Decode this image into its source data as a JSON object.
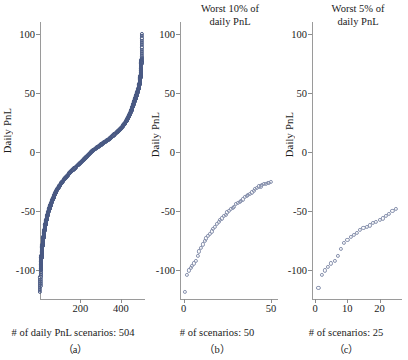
{
  "figure": {
    "ylabel": "Daily PnL",
    "ylim": [
      -125,
      110
    ],
    "yticks": [
      100,
      50,
      0,
      -50,
      -100
    ],
    "ytick_labels": [
      "100",
      "50",
      "0",
      "-50",
      "-100"
    ]
  },
  "panels": [
    {
      "id": "a",
      "title": "",
      "subcaption": "（a）",
      "xcaption": "# of daily PnL scenarios: 504",
      "xlim": [
        0,
        520
      ],
      "xticks": [
        200,
        400
      ],
      "xtick_labels": [
        "200",
        "400"
      ],
      "n_scenarios": 504,
      "dense": true
    },
    {
      "id": "b",
      "title": "Worst 10% of\ndaily PnL",
      "subcaption": "（b）",
      "xcaption": "# of scenarios: 50",
      "xlim": [
        -2,
        54
      ],
      "xticks": [
        0,
        50
      ],
      "xtick_labels": [
        "0",
        "50"
      ],
      "n_scenarios": 50,
      "dense": false
    },
    {
      "id": "c",
      "title": "Worst 5% of\ndaily PnL",
      "subcaption": "（c）",
      "xcaption": "# of scenarios: 25",
      "xlim": [
        -1,
        27
      ],
      "xticks": [
        0,
        10,
        20
      ],
      "xtick_labels": [
        "0",
        "10",
        "20"
      ],
      "n_scenarios": 25,
      "dense": false
    }
  ],
  "chart_data": {
    "type": "scatter",
    "xlabel": "# of scenarios",
    "ylabel": "Daily PnL",
    "ylim": [
      -125,
      110
    ],
    "grid": false,
    "legend": null,
    "marker": "open-circle",
    "colors": {
      "dense_markers": "#4a5a84",
      "sparse_markers": "#8791ad",
      "axis": "#9a9a9a",
      "text": "#1a1a1a",
      "background": "#ffffff"
    },
    "panels": [
      {
        "id": "a",
        "label": "(a)",
        "title": "",
        "xlabel": "# of daily PnL scenarios: 504",
        "n_points": 504,
        "xlim": [
          0,
          520
        ],
        "xticks": [
          200,
          400
        ],
        "yticks": [
          100,
          50,
          0,
          -50,
          -100
        ],
        "description": "Sorted ascending daily PnL for all 504 scenarios; steep negative tail below index 40, flat sigmoid centre, steep positive tail above index 460.",
        "x": [
          1,
          3,
          5,
          7,
          9,
          11,
          14,
          17,
          20,
          24,
          28,
          32,
          36,
          40,
          46,
          52,
          60,
          70,
          80,
          95,
          110,
          130,
          150,
          175,
          200,
          225,
          252,
          275,
          300,
          325,
          350,
          375,
          395,
          415,
          430,
          442,
          452,
          460,
          466,
          472,
          478,
          483,
          488,
          492,
          496,
          499,
          501,
          503,
          504
        ],
        "y": [
          -118,
          -100,
          -95,
          -88,
          -84,
          -80,
          -76,
          -72,
          -68,
          -64,
          -60,
          -57,
          -54,
          -51,
          -48,
          -45,
          -41,
          -37,
          -33,
          -29,
          -25,
          -21,
          -17,
          -13,
          -9,
          -5,
          0,
          3,
          6,
          9,
          12,
          16,
          19,
          23,
          27,
          31,
          35,
          39,
          42,
          45,
          48,
          51,
          54,
          57,
          62,
          66,
          72,
          80,
          100
        ]
      },
      {
        "id": "b",
        "label": "(b)",
        "title": "Worst 10% of daily PnL",
        "xlabel": "# of scenarios: 50",
        "n_points": 50,
        "xlim": [
          -2,
          54
        ],
        "xticks": [
          0,
          50
        ],
        "yticks": [
          100,
          50,
          0,
          -50,
          -100
        ],
        "description": "Worst 10% tail: 50 sorted points rising concavely from about -118 to about -25.",
        "x": [
          1,
          2,
          3,
          4,
          5,
          6,
          7,
          8,
          9,
          10,
          11,
          12,
          13,
          14,
          15,
          16,
          17,
          18,
          19,
          20,
          21,
          22,
          23,
          24,
          25,
          26,
          27,
          28,
          29,
          30,
          31,
          32,
          33,
          34,
          35,
          36,
          37,
          38,
          39,
          40,
          41,
          42,
          43,
          44,
          45,
          46,
          47,
          48,
          49,
          50
        ],
        "y": [
          -118,
          -104,
          -100,
          -98,
          -96,
          -94,
          -92,
          -88,
          -84,
          -81,
          -78,
          -75,
          -73,
          -71,
          -69,
          -67,
          -65,
          -63,
          -61,
          -59,
          -57,
          -56,
          -54,
          -53,
          -51,
          -50,
          -48,
          -47,
          -46,
          -44,
          -43,
          -42,
          -41,
          -40,
          -38,
          -37,
          -36,
          -35,
          -34,
          -33,
          -31,
          -30,
          -29,
          -29,
          -28,
          -27,
          -27,
          -26,
          -26,
          -25
        ]
      },
      {
        "id": "c",
        "label": "(c)",
        "title": "Worst 5% of daily PnL",
        "xlabel": "# of scenarios: 25",
        "n_points": 25,
        "xlim": [
          -1,
          27
        ],
        "xticks": [
          0,
          10,
          20
        ],
        "yticks": [
          100,
          50,
          0,
          -50,
          -100
        ],
        "description": "Worst 5% tail: 25 sorted points rising from about -115 to about -48.",
        "x": [
          1,
          2,
          3,
          4,
          5,
          6,
          7,
          8,
          9,
          10,
          11,
          12,
          13,
          14,
          15,
          16,
          17,
          18,
          19,
          20,
          21,
          22,
          23,
          24,
          25
        ],
        "y": [
          -115,
          -104,
          -100,
          -97,
          -94,
          -92,
          -88,
          -82,
          -77,
          -74,
          -72,
          -70,
          -68,
          -66,
          -64,
          -63,
          -62,
          -60,
          -59,
          -57,
          -56,
          -54,
          -52,
          -50,
          -48
        ]
      }
    ]
  }
}
